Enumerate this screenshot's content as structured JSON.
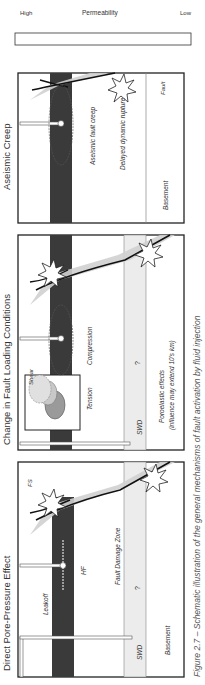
{
  "figure": {
    "caption": "Figure 2.7 – Schematic illustration of the general mechanisms of fault activation by fluid injection",
    "legend": {
      "title": "Permeability",
      "high_label": "High",
      "low_label": "Low"
    },
    "panels": [
      {
        "title": "Direct Pore-Pressure Effect",
        "labels": {
          "fs": "FS",
          "leakoff": "Leakoff",
          "hf": "HF",
          "fault_damage_zone": "Fault Damage Zone",
          "swd": "SWD",
          "basement": "Basement",
          "unknown": "?"
        }
      },
      {
        "title": "Change in Fault Loading Conditions",
        "labels": {
          "shear": "Shear",
          "tension": "Tension",
          "compression": "Compression",
          "swd": "SWD",
          "poroelastic": "Poroelastic effects",
          "influence": "(influence may extend 10's km)",
          "unknown": "?"
        }
      },
      {
        "title": "Aseismic Creep",
        "labels": {
          "aseismic_fault_creep": "Aseismic fault creep",
          "delayed_rupture": "Delayed dynamic rupture",
          "fault": "Fault",
          "basement": "Basement"
        }
      }
    ],
    "colors": {
      "reservoir": "#3a3a3a",
      "aquifer": "#ececec",
      "fault_zone": "#d0d0d0",
      "frame": "#222222",
      "text": "#333333"
    }
  }
}
